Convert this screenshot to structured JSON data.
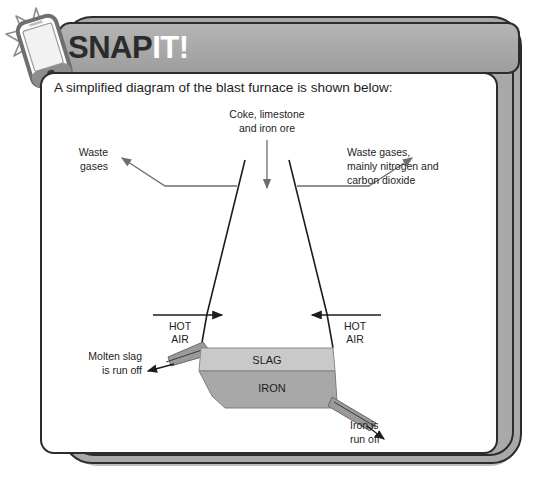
{
  "callout": {
    "title_part1": "SNAP",
    "title_part2": "IT!",
    "phone_icon": "smartphone-flash-icon",
    "intro": "A simplified diagram of the blast furnace is shown below:"
  },
  "diagram": {
    "name": "blast-furnace-diagram",
    "feed_label_line1": "Coke, limestone",
    "feed_label_line2": "and iron ore",
    "waste_left_line1": "Waste",
    "waste_left_line2": "gases",
    "waste_right_line1": "Waste gases,",
    "waste_right_line2": "mainly nitrogen and",
    "waste_right_line3": "carbon dioxide",
    "hot_air_left_line1": "HOT",
    "hot_air_left_line2": "AIR",
    "hot_air_right_line1": "HOT",
    "hot_air_right_line2": "AIR",
    "slag_layer_label": "SLAG",
    "iron_layer_label": "IRON",
    "molten_slag_line1": "Molten slag",
    "molten_slag_line2": "is run off",
    "iron_out_line1": "Iron is",
    "iron_out_line2": "run off"
  },
  "colors": {
    "frame_gray": "#a9a9a9",
    "outline_dark": "#2c2c2c",
    "slag_fill": "#c9c9c9",
    "iron_fill": "#a8a8a8",
    "spout_fill": "#9a9a9a",
    "arrow_gray": "#6e6e6e",
    "text_dark": "#1d1d1d",
    "title_white": "#ffffff"
  }
}
